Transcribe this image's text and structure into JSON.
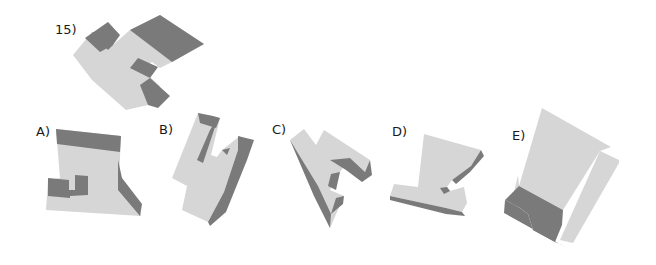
{
  "question": {
    "number_label": "15)"
  },
  "options": [
    {
      "id": "A",
      "label": "A)"
    },
    {
      "id": "B",
      "label": "B)"
    },
    {
      "id": "C",
      "label": "C)"
    },
    {
      "id": "D",
      "label": "D)"
    },
    {
      "id": "E",
      "label": "E)"
    }
  ],
  "colors": {
    "light_face": "#d6d6d6",
    "dark_face": "#7a7a7a",
    "background": "#ffffff"
  }
}
